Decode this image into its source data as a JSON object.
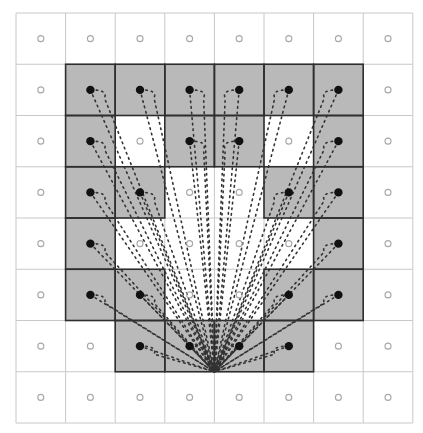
{
  "diagram": {
    "title": "",
    "grid": {
      "rows": 8,
      "cols": 8,
      "origin_x": 16,
      "origin_y": 13,
      "cell_w": 49.6,
      "cell_h": 51.25
    },
    "colors": {
      "background": "#ffffff",
      "grid_line": "#c8c8c8",
      "shaded_fill": "#b9b9b9",
      "shaded_border": "#2e2e2e",
      "active_dot": "#111111",
      "inactive_dot": "#a8a8a8",
      "ray": "#333333"
    },
    "shaded_cells": [
      [
        0,
        0,
        0,
        0,
        0,
        0,
        0,
        0
      ],
      [
        0,
        1,
        1,
        1,
        1,
        1,
        1,
        0
      ],
      [
        0,
        1,
        0,
        1,
        1,
        0,
        1,
        0
      ],
      [
        0,
        1,
        1,
        0,
        0,
        1,
        1,
        0
      ],
      [
        0,
        1,
        0,
        0,
        0,
        0,
        1,
        0
      ],
      [
        0,
        1,
        1,
        0,
        0,
        1,
        1,
        0
      ],
      [
        0,
        0,
        1,
        1,
        1,
        1,
        0,
        0
      ],
      [
        0,
        0,
        0,
        0,
        0,
        0,
        0,
        0
      ]
    ],
    "target_point": {
      "row_edge": 6,
      "col_edge": 4,
      "description": "convergence point on bottom edge of row 6 between columns 3 and 4"
    },
    "legend": []
  }
}
